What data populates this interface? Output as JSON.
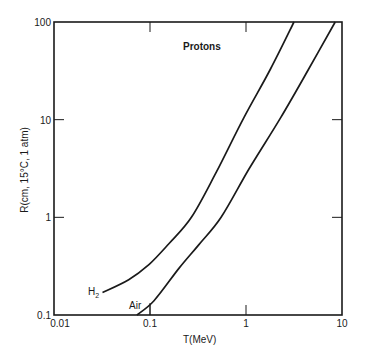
{
  "chart_data": {
    "type": "line",
    "title": "Protons",
    "xlabel": "T(MeV)",
    "ylabel": "R(cm, 15°C, 1 atm)",
    "xscale": "log",
    "yscale": "log",
    "xlim": [
      0.01,
      10
    ],
    "ylim": [
      0.1,
      100
    ],
    "xticks": [
      0.01,
      0.1,
      1,
      10
    ],
    "xtick_labels": [
      "0.01",
      "0.1",
      "1",
      "10"
    ],
    "yticks": [
      0.1,
      1,
      10,
      100
    ],
    "ytick_labels": [
      "0.1",
      "1",
      "10",
      "100"
    ],
    "grid": false,
    "legend": "inline labels near curve starts",
    "series": [
      {
        "name": "H2",
        "label": "H",
        "label_sub": "2",
        "x": [
          0.032,
          0.06,
          0.098,
          0.158,
          0.27,
          0.49,
          0.95,
          1.8,
          3.16
        ],
        "y": [
          0.17,
          0.23,
          0.33,
          0.54,
          1.0,
          2.9,
          10.5,
          33,
          100
        ]
      },
      {
        "name": "Air",
        "label": "Air",
        "x": [
          0.073,
          0.11,
          0.2,
          0.32,
          0.55,
          1.07,
          2.3,
          4.5,
          8.5
        ],
        "y": [
          0.1,
          0.14,
          0.3,
          0.52,
          1.0,
          3.1,
          10.5,
          33,
          100
        ]
      }
    ]
  },
  "colors": {
    "line": "#1a1a1a",
    "background": "#ffffff"
  }
}
